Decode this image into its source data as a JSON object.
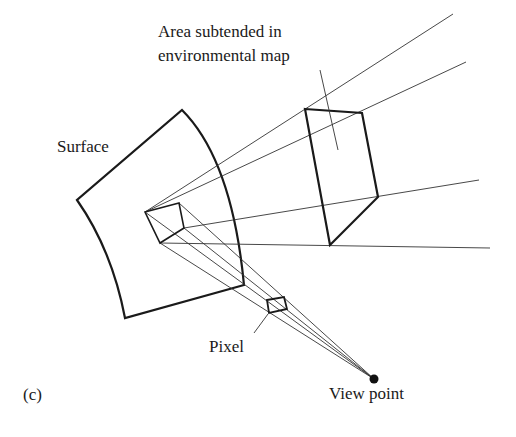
{
  "figure": {
    "panel_label": "(c)",
    "labels": {
      "area": [
        "Area subtended in",
        "environmental map"
      ],
      "surface": "Surface",
      "pixel": "Pixel",
      "viewpoint": "View point"
    },
    "colors": {
      "stroke": "#1a1a1a",
      "background": "#ffffff"
    }
  }
}
